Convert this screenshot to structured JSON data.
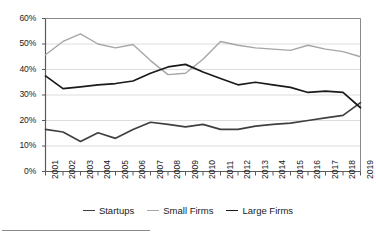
{
  "chart_data": {
    "type": "line",
    "title": "",
    "xlabel": "",
    "ylabel": "",
    "ylim": [
      0,
      60
    ],
    "ytick_labels": [
      "0%",
      "10%",
      "20%",
      "30%",
      "40%",
      "50%",
      "60%"
    ],
    "ytick_values": [
      0,
      10,
      20,
      30,
      40,
      50,
      60
    ],
    "grid": true,
    "legend_position": "bottom",
    "categories": [
      "2001",
      "2002",
      "2003",
      "2004",
      "2005",
      "2006",
      "2007",
      "2008",
      "2009",
      "2010",
      "2011",
      "2012",
      "2013",
      "2014",
      "2015",
      "2016",
      "2017",
      "2018",
      "2019"
    ],
    "series": [
      {
        "name": "Startups",
        "color": "#404040",
        "values": [
          16.5,
          15.5,
          11.8,
          15.2,
          13.0,
          16.5,
          19.3,
          18.5,
          17.5,
          18.5,
          16.5,
          16.5,
          17.8,
          18.5,
          19.0,
          20.0,
          21.0,
          22.0,
          27.0
        ]
      },
      {
        "name": "Small Firms",
        "color": "#a6a6a6",
        "values": [
          45.8,
          51.0,
          54.0,
          50.0,
          48.5,
          49.8,
          43.5,
          38.0,
          38.5,
          44.0,
          51.0,
          49.5,
          48.5,
          48.0,
          47.5,
          49.5,
          48.0,
          47.0,
          45.0
        ]
      },
      {
        "name": "Large Firms",
        "color": "#1a1a1a",
        "values": [
          37.5,
          32.5,
          33.2,
          34.0,
          34.5,
          35.5,
          38.5,
          41.0,
          42.0,
          39.0,
          36.5,
          34.0,
          35.0,
          34.0,
          33.0,
          31.0,
          31.5,
          31.0,
          25.0
        ]
      }
    ]
  },
  "legend": {
    "items": [
      {
        "label": "Startups"
      },
      {
        "label": "Small Firms"
      },
      {
        "label": "Large Firms"
      }
    ]
  }
}
